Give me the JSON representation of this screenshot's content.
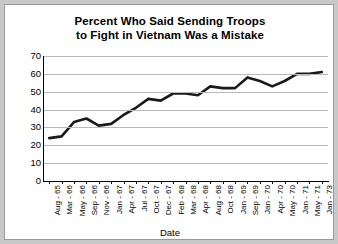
{
  "chart_data": {
    "type": "line",
    "title": "Percent Who Said Sending Troops to Fight in Vietnam Was a Mistake",
    "title_lines": [
      "Percent Who Said Sending Troops",
      "to Fight in Vietnam Was a Mistake"
    ],
    "xlabel": "Date",
    "ylabel": "",
    "ylim": [
      0,
      70
    ],
    "yticks": [
      0,
      10,
      20,
      30,
      40,
      50,
      60,
      70
    ],
    "ytick_labels": [
      "0",
      "10",
      "20",
      "30",
      "40",
      "50",
      "60",
      "70"
    ],
    "grid": true,
    "grid_axis": "y",
    "legend": false,
    "line_color": "#1a1a1a",
    "categories": [
      "Aug - 65",
      "Mar - 66",
      "May - 66",
      "Sep - 66",
      "Nov - 66",
      "Jan - 67",
      "Apr - 67",
      "Jul - 67",
      "Oct - 67",
      "Dec - 67",
      "Feb - 68",
      "Mar - 68",
      "Apr - 68",
      "Aug - 68",
      "Oct - 68",
      "Jan - 69",
      "Sep - 69",
      "Jan - 70",
      "Apr - 70",
      "May - 70",
      "Jan - 71",
      "May - 71",
      "Jan - 73"
    ],
    "values": [
      24,
      25,
      33,
      35,
      31,
      32,
      37,
      41,
      46,
      45,
      49,
      49,
      48,
      53,
      52,
      52,
      58,
      56,
      53,
      56,
      60,
      60,
      61
    ]
  }
}
